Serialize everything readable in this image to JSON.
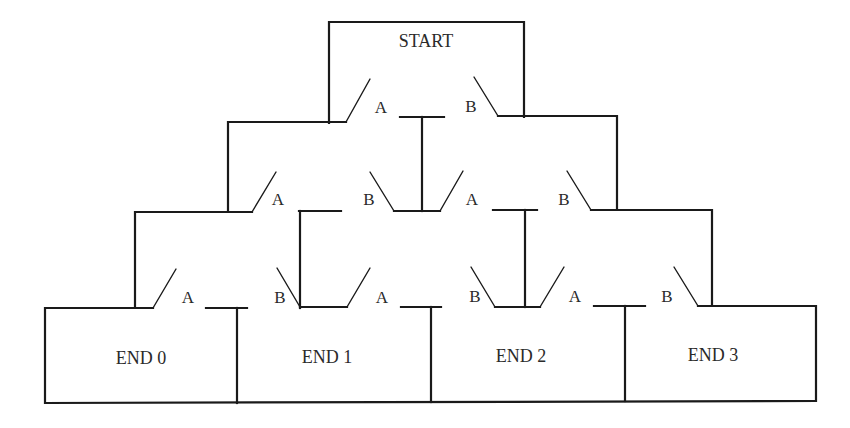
{
  "diagram": {
    "start_label": "START",
    "end_labels": [
      "END 0",
      "END 1",
      "END 2",
      "END 3"
    ],
    "switch_labels": {
      "row1": [
        "A",
        "B"
      ],
      "row2": [
        "A",
        "B",
        "A",
        "B"
      ],
      "row3": [
        "A",
        "B",
        "A",
        "B",
        "A",
        "B"
      ]
    },
    "colors": {
      "line": "#1a1a1a",
      "text": "#2a2a2a",
      "background": "#ffffff"
    }
  }
}
